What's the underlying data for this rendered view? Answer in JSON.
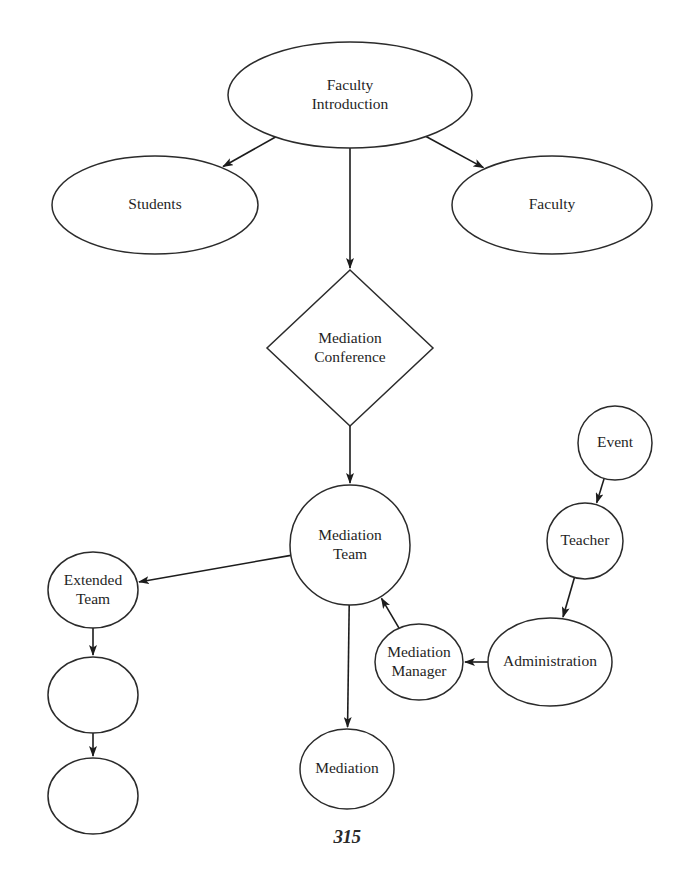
{
  "document": {
    "copyright": "© 1996 by Ruth Perlstein and Gloria Thrall",
    "page_number": "315"
  },
  "diagram": {
    "stroke_color": "#2b2b2b",
    "fill_color": "#ffffff",
    "text_color": "#1f1f1f",
    "nodes": [
      {
        "id": "faculty-introduction",
        "label": "Faculty Introduction",
        "lines": [
          "Faculty",
          "Introduction"
        ],
        "shape": "ellipse",
        "cx": 350,
        "cy": 95,
        "rx": 122,
        "ry": 53
      },
      {
        "id": "students",
        "label": "Students",
        "lines": [
          "Students"
        ],
        "shape": "ellipse",
        "cx": 155,
        "cy": 205,
        "rx": 103,
        "ry": 49
      },
      {
        "id": "faculty",
        "label": "Faculty",
        "lines": [
          "Faculty"
        ],
        "shape": "ellipse",
        "cx": 552,
        "cy": 205,
        "rx": 100,
        "ry": 49
      },
      {
        "id": "mediation-conference",
        "label": "Mediation Conference",
        "lines": [
          "Mediation",
          "Conference"
        ],
        "shape": "diamond",
        "cx": 350,
        "cy": 348,
        "rx": 83,
        "ry": 78
      },
      {
        "id": "mediation-team",
        "label": "Mediation Team",
        "lines": [
          "Mediation",
          "Team"
        ],
        "shape": "ellipse",
        "cx": 350,
        "cy": 545,
        "rx": 60,
        "ry": 60
      },
      {
        "id": "extended-team",
        "label": "Extended Team",
        "lines": [
          "Extended",
          "Team"
        ],
        "shape": "ellipse",
        "cx": 93,
        "cy": 590,
        "rx": 45,
        "ry": 38
      },
      {
        "id": "extended-team-child-1",
        "label": "",
        "lines": [],
        "shape": "ellipse",
        "cx": 93,
        "cy": 695,
        "rx": 45,
        "ry": 38
      },
      {
        "id": "extended-team-child-2",
        "label": "",
        "lines": [],
        "shape": "ellipse",
        "cx": 93,
        "cy": 796,
        "rx": 45,
        "ry": 38
      },
      {
        "id": "mediation",
        "label": "Mediation",
        "lines": [
          "Mediation"
        ],
        "shape": "ellipse",
        "cx": 347,
        "cy": 769,
        "rx": 47,
        "ry": 40
      },
      {
        "id": "mediation-manager",
        "label": "Mediation Manager",
        "lines": [
          "Mediation",
          "Manager"
        ],
        "shape": "ellipse",
        "cx": 419,
        "cy": 662,
        "rx": 44,
        "ry": 38
      },
      {
        "id": "administration",
        "label": "Administration",
        "lines": [
          "Administration"
        ],
        "shape": "ellipse",
        "cx": 550,
        "cy": 662,
        "rx": 62,
        "ry": 44
      },
      {
        "id": "teacher",
        "label": "Teacher",
        "lines": [
          "Teacher"
        ],
        "shape": "ellipse",
        "cx": 585,
        "cy": 541,
        "rx": 38,
        "ry": 38
      },
      {
        "id": "event",
        "label": "Event",
        "lines": [
          "Event"
        ],
        "shape": "ellipse",
        "cx": 615,
        "cy": 443,
        "rx": 37,
        "ry": 37
      }
    ],
    "edges": [
      {
        "id": "edge-faculty-introduction-students",
        "from": "faculty-introduction",
        "to": "students",
        "arrow": true
      },
      {
        "id": "edge-faculty-introduction-faculty",
        "from": "faculty-introduction",
        "to": "faculty",
        "arrow": true
      },
      {
        "id": "edge-faculty-introduction-mediation-conference",
        "from": "faculty-introduction",
        "to": "mediation-conference",
        "arrow": true
      },
      {
        "id": "edge-mediation-conference-mediation-team",
        "from": "mediation-conference",
        "to": "mediation-team",
        "arrow": true
      },
      {
        "id": "edge-mediation-team-extended-team",
        "from": "mediation-team",
        "to": "extended-team",
        "arrow": true
      },
      {
        "id": "edge-extended-team-child-1",
        "from": "extended-team",
        "to": "extended-team-child-1",
        "arrow": true
      },
      {
        "id": "edge-child-1-child-2",
        "from": "extended-team-child-1",
        "to": "extended-team-child-2",
        "arrow": true
      },
      {
        "id": "edge-mediation-team-mediation",
        "from": "mediation-team",
        "to": "mediation",
        "arrow": true
      },
      {
        "id": "edge-mediation-manager-mediation-team",
        "from": "mediation-manager",
        "to": "mediation-team",
        "arrow": true
      },
      {
        "id": "edge-administration-mediation-manager",
        "from": "administration",
        "to": "mediation-manager",
        "arrow": true
      },
      {
        "id": "edge-teacher-administration",
        "from": "teacher",
        "to": "administration",
        "arrow": true
      },
      {
        "id": "edge-event-teacher",
        "from": "event",
        "to": "teacher",
        "arrow": true
      }
    ]
  }
}
